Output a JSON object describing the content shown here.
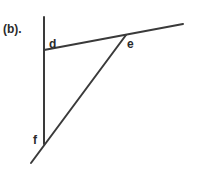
{
  "figure": {
    "panel_label": "(b).",
    "points": {
      "d": {
        "label": "d"
      },
      "e": {
        "label": "e"
      },
      "f": {
        "label": "f"
      }
    },
    "line_color": "#3a3a3a"
  }
}
